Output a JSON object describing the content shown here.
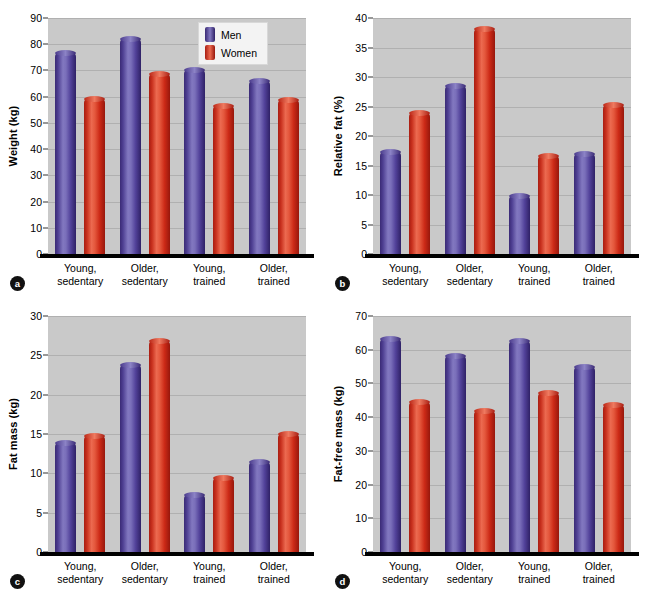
{
  "figure": {
    "background": "#ffffff",
    "plot_background": "#c9c9c9",
    "men_color": "#5b4aa0",
    "women_color": "#d4381f"
  },
  "legend": {
    "men": "Men",
    "women": "Women"
  },
  "categories": [
    "Young,\nsedentary",
    "Older,\nsedentary",
    "Young,\ntrained",
    "Older,\ntrained"
  ],
  "category_lines": [
    {
      "l1": "Young,",
      "l2": "sedentary"
    },
    {
      "l1": "Older,",
      "l2": "sedentary"
    },
    {
      "l1": "Young,",
      "l2": "trained"
    },
    {
      "l1": "Older,",
      "l2": "trained"
    }
  ],
  "panels": [
    {
      "letter": "a",
      "ylabel": "Weight (kg)",
      "ticks": [
        0,
        10,
        20,
        30,
        40,
        50,
        60,
        70,
        80,
        90
      ]
    },
    {
      "letter": "b",
      "ylabel": "Relative fat (%)",
      "ticks": [
        0,
        5,
        10,
        15,
        20,
        25,
        30,
        35,
        40
      ]
    },
    {
      "letter": "c",
      "ylabel": "Fat mass (kg)",
      "ticks": [
        0,
        5,
        10,
        15,
        20,
        25,
        30
      ]
    },
    {
      "letter": "d",
      "ylabel": "Fat-free mass (kg)",
      "ticks": [
        0,
        10,
        20,
        30,
        40,
        50,
        60,
        70
      ]
    }
  ],
  "chart_data": [
    {
      "type": "bar",
      "panel": "a",
      "title": "",
      "xlabel": "",
      "ylabel": "Weight (kg)",
      "ylim": [
        0,
        90
      ],
      "ytick_step": 10,
      "grid": true,
      "legend_position": "top-right",
      "categories": [
        "Young, sedentary",
        "Older, sedentary",
        "Young, trained",
        "Older, trained"
      ],
      "series": [
        {
          "name": "Men",
          "color": "#5b4aa0",
          "values": [
            76.7,
            82.0,
            70.0,
            66.0
          ]
        },
        {
          "name": "Women",
          "color": "#d4381f",
          "values": [
            59.2,
            68.8,
            56.5,
            58.8
          ]
        }
      ]
    },
    {
      "type": "bar",
      "panel": "b",
      "title": "",
      "xlabel": "",
      "ylabel": "Relative fat (%)",
      "ylim": [
        0,
        40
      ],
      "ytick_step": 5,
      "grid": true,
      "legend_position": "none",
      "categories": [
        "Young, sedentary",
        "Older, sedentary",
        "Young, trained",
        "Older, trained"
      ],
      "series": [
        {
          "name": "Men",
          "color": "#5b4aa0",
          "values": [
            17.3,
            28.5,
            9.9,
            17.0
          ]
        },
        {
          "name": "Women",
          "color": "#d4381f",
          "values": [
            23.9,
            38.2,
            16.6,
            25.3
          ]
        }
      ]
    },
    {
      "type": "bar",
      "panel": "c",
      "title": "",
      "xlabel": "",
      "ylabel": "Fat mass (kg)",
      "ylim": [
        0,
        30
      ],
      "ytick_step": 5,
      "grid": true,
      "legend_position": "none",
      "categories": [
        "Young, sedentary",
        "Older, sedentary",
        "Young, trained",
        "Older, trained"
      ],
      "series": [
        {
          "name": "Men",
          "color": "#5b4aa0",
          "values": [
            13.8,
            23.8,
            7.3,
            11.4
          ]
        },
        {
          "name": "Women",
          "color": "#d4381f",
          "values": [
            14.7,
            26.8,
            9.4,
            15.0
          ]
        }
      ]
    },
    {
      "type": "bar",
      "panel": "d",
      "title": "",
      "xlabel": "",
      "ylabel": "Fat-free mass (kg)",
      "ylim": [
        0,
        70
      ],
      "ytick_step": 10,
      "grid": true,
      "legend_position": "none",
      "categories": [
        "Young, sedentary",
        "Older, sedentary",
        "Young, trained",
        "Older, trained"
      ],
      "series": [
        {
          "name": "Men",
          "color": "#5b4aa0",
          "values": [
            63.2,
            58.1,
            62.7,
            54.8
          ]
        },
        {
          "name": "Women",
          "color": "#d4381f",
          "values": [
            44.5,
            41.8,
            47.3,
            43.7
          ]
        }
      ]
    }
  ]
}
